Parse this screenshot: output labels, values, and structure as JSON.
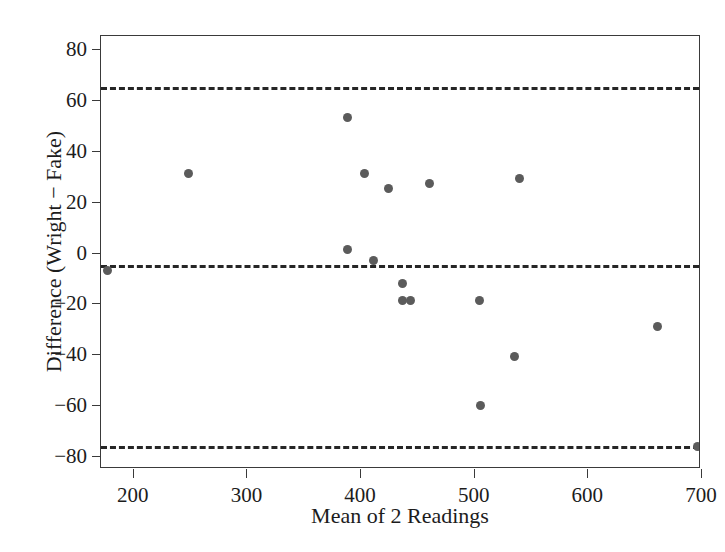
{
  "chart_data": {
    "type": "scatter",
    "title": "",
    "xlabel": "Mean of 2 Readings",
    "ylabel": "Difference (Wright − Fake)",
    "xlim": [
      172,
      700
    ],
    "ylim": [
      -85,
      85
    ],
    "xticks": [
      200,
      300,
      400,
      500,
      600,
      700
    ],
    "xticklabels": [
      "200",
      "300",
      "400",
      "500",
      "600",
      "700"
    ],
    "yticks": [
      80,
      60,
      40,
      20,
      0,
      -20,
      -40,
      -60,
      -80
    ],
    "yticklabels": [
      "80",
      "60",
      "40",
      "20",
      "0",
      "−20",
      "−40",
      "−60",
      "−80"
    ],
    "grid": false,
    "legend": null,
    "marker_color": "#5b5b5b",
    "line_color": "#262626",
    "axis_color": "#3a3a3a",
    "reference_lines": [
      {
        "name": "upper-limit-of-agreement",
        "y": 65,
        "style": "dashed"
      },
      {
        "name": "mean-bias",
        "y": -5,
        "style": "dashed"
      },
      {
        "name": "lower-limit-of-agreement",
        "y": -76,
        "style": "dashed"
      }
    ],
    "points": [
      {
        "x": 178,
        "y": -7
      },
      {
        "x": 249,
        "y": 31
      },
      {
        "x": 389,
        "y": 53
      },
      {
        "x": 389,
        "y": 1
      },
      {
        "x": 404,
        "y": 31
      },
      {
        "x": 412,
        "y": -3
      },
      {
        "x": 425,
        "y": 25
      },
      {
        "x": 437,
        "y": -12
      },
      {
        "x": 437,
        "y": -19
      },
      {
        "x": 444,
        "y": -19
      },
      {
        "x": 461,
        "y": 27
      },
      {
        "x": 505,
        "y": -19
      },
      {
        "x": 506,
        "y": -60
      },
      {
        "x": 536,
        "y": -41
      },
      {
        "x": 540,
        "y": 29
      },
      {
        "x": 662,
        "y": -29
      },
      {
        "x": 697,
        "y": -76
      }
    ]
  }
}
